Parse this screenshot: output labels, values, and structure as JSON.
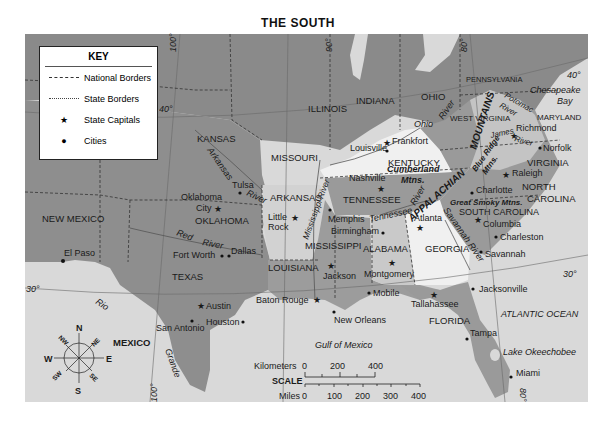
{
  "title": "THE SOUTH",
  "key": {
    "title": "KEY",
    "items": [
      {
        "symbol": "long-dash",
        "label": "National Borders"
      },
      {
        "symbol": "short-dash",
        "label": "State Borders"
      },
      {
        "symbol": "star",
        "label": "State Capitals"
      },
      {
        "symbol": "dot",
        "label": "Cities"
      }
    ]
  },
  "colors": {
    "ocean": "#dcdcdc",
    "land_other": "#8c8c8c",
    "south_dark": "#9a9a9a",
    "south_light": "#d4d4d4",
    "highlight_white": "#f2f2f2"
  },
  "states": {
    "new_mexico": "NEW MEXICO",
    "kansas": "KANSAS",
    "missouri": "MISSOURI",
    "illinois": "ILLINOIS",
    "indiana": "INDIANA",
    "ohio": "OHIO",
    "pennsylvania": "PENNSYLVANIA",
    "west_virginia": "WEST VIRGINIA",
    "maryland": "MARYLAND",
    "virginia": "VIRGINIA",
    "kentucky": "KENTUCKY",
    "tennessee": "TENNESSEE",
    "north_carolina": "NORTH CAROLINA",
    "south_carolina": "SOUTH CAROLINA",
    "georgia": "GEORGIA",
    "alabama": "ALABAMA",
    "mississippi": "MISSISSIPPI",
    "louisiana": "LOUISIANA",
    "arkansas": "ARKANSAS",
    "oklahoma": "OKLAHOMA",
    "texas": "TEXAS",
    "florida": "FLORIDA",
    "mexico": "MEXICO"
  },
  "capitals": [
    "Frankfort",
    "Nashville",
    "Richmond",
    "Raleigh",
    "Columbia",
    "Atlanta",
    "Montgomery",
    "Jackson",
    "Little Rock",
    "Oklahoma City",
    "Austin",
    "Baton Rouge",
    "Tallahassee"
  ],
  "cities": [
    "Louisville",
    "Norfolk",
    "Charlotte",
    "Charleston",
    "Savannah",
    "Birmingham",
    "Memphis",
    "Mobile",
    "New Orleans",
    "Tulsa",
    "Dallas",
    "Fort Worth",
    "Houston",
    "San Antonio",
    "El Paso",
    "Jacksonville",
    "Tampa",
    "Miami"
  ],
  "labels": {
    "city_oklahoma": "Oklahoma",
    "city_city": "City",
    "city_little": "Little",
    "city_rock": "Rock",
    "frankfort": "Frankfort",
    "nashville": "Nashville",
    "richmond": "Richmond",
    "raleigh": "Raleigh",
    "columbia": "Columbia",
    "atlanta": "Atlanta",
    "montgomery": "Montgomery",
    "jackson": "Jackson",
    "austin": "Austin",
    "baton_rouge": "Baton Rouge",
    "tallahassee": "Tallahassee",
    "louisville": "Louisville",
    "norfolk": "Norfolk",
    "charlotte": "Charlotte",
    "charleston": "Charleston",
    "savannah": "Savannah",
    "birmingham": "Birmingham",
    "memphis": "Memphis",
    "mobile": "Mobile",
    "new_orleans": "New Orleans",
    "tulsa": "Tulsa",
    "dallas": "Dallas",
    "fort_worth": "Fort Worth",
    "houston": "Houston",
    "san_antonio": "San Antonio",
    "el_paso": "El Paso",
    "jacksonville": "Jacksonville",
    "tampa": "Tampa",
    "miami": "Miami"
  },
  "features": {
    "appalachian": "APPALACHIAN",
    "mountains": "MOUNTAINS",
    "blue_ridge": "Blue Ridge",
    "blue_ridge_mtns": "Mtns.",
    "cumberland": "Cumberland",
    "cumberland_mtns": "Mtns.",
    "great_smoky": "Great Smoky Mtns.",
    "chesapeake": "Chesapeake",
    "bay": "Bay",
    "gulf": "Gulf of Mexico",
    "atlantic": "ATLANTIC OCEAN",
    "okeechobee": "Lake Okeechobee"
  },
  "rivers": {
    "arkansas": "Arkansas",
    "arkansas_river": "River",
    "red": "Red",
    "red_river": "River",
    "rio": "Rio",
    "grande": "Grande",
    "mississippi": "Mississippi River",
    "ohio": "Ohio",
    "ohio_river": "River",
    "tennessee": "Tennessee",
    "tennessee_river": "River",
    "savannah": "Savannah River",
    "potomac": "Potomac",
    "potomac_river": "River",
    "james": "James",
    "james_river": "River"
  },
  "graticule": {
    "lat_40_w": "40°",
    "lat_40_e": "40°",
    "lat_30_w": "30°",
    "lat_30_e": "30°",
    "lon_100_n": "100°",
    "lon_90_n": "90°",
    "lon_80_n": "80°",
    "lon_100_s": "100°",
    "lon_80_s": "80°"
  },
  "compass": {
    "n": "N",
    "s": "S",
    "e": "E",
    "w": "W",
    "ne": "NE",
    "nw": "NW",
    "se": "SE",
    "sw": "SW"
  },
  "scale": {
    "title": "SCALE",
    "km_label": "Kilometers",
    "km_ticks": [
      "0",
      "200",
      "400"
    ],
    "mi_label": "Miles",
    "mi_ticks": [
      "0",
      "100",
      "200",
      "300",
      "400"
    ]
  }
}
